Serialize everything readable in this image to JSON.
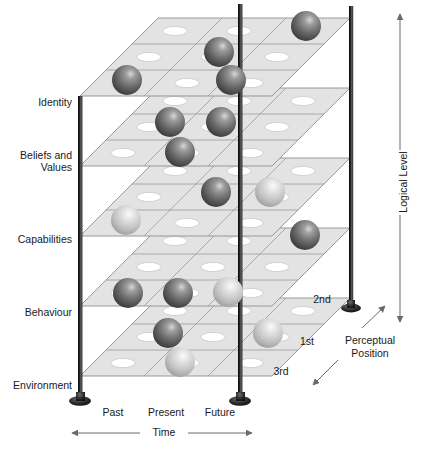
{
  "figure": {
    "type": "diagram",
    "background_color": "#ffffff",
    "line_color": "#1a1a1a",
    "plane_fill": "#e2e2e2",
    "plane_edge": "#9a9a9a",
    "cell_hole_fill": "#ffffff",
    "sphere_dark": "#6f6f6f",
    "sphere_light": "#cdcdcd"
  },
  "axes": {
    "vertical": {
      "label": "Logical Level",
      "arrow": "double",
      "levels": [
        {
          "label": "Identity"
        },
        {
          "label": "Beliefs and"
        },
        {
          "label": "Values"
        },
        {
          "label": "Capabilities"
        },
        {
          "label": "Behaviour"
        },
        {
          "label": "Environment"
        }
      ]
    },
    "horizontal": {
      "label": "Time",
      "arrow": "double",
      "ticks": [
        "Past",
        "Present",
        "Future"
      ]
    },
    "depth": {
      "label_line1": "Perceptual",
      "label_line2": "Position",
      "arrow": "double",
      "positions": [
        "1st",
        "2nd",
        "3rd"
      ]
    }
  },
  "level_labels": {
    "identity": "Identity",
    "beliefs": "Beliefs and",
    "values": "Values",
    "capabilities": "Capabilities",
    "behaviour": "Behaviour",
    "environment": "Environment"
  },
  "time_labels": {
    "past": "Past",
    "present": "Present",
    "future": "Future",
    "axis": "Time"
  },
  "perceptual_labels": {
    "first": "1st",
    "second": "2nd",
    "third": "3rd",
    "axis_line1": "Perceptual",
    "axis_line2": "Position"
  },
  "logical_axis_label": "Logical Level",
  "planes": [
    {
      "name": "identity-plane",
      "level": "Identity",
      "rows": 3,
      "cols": 3
    },
    {
      "name": "beliefs-plane",
      "level": "Beliefs and Values",
      "rows": 3,
      "cols": 3
    },
    {
      "name": "capabilities-plane",
      "level": "Capabilities",
      "rows": 3,
      "cols": 3
    },
    {
      "name": "behaviour-plane",
      "level": "Behaviour",
      "rows": 3,
      "cols": 3
    },
    {
      "name": "environment-plane",
      "level": "Environment",
      "rows": 3,
      "cols": 3
    }
  ],
  "poles": [
    {
      "name": "pole-left",
      "has_base": true
    },
    {
      "name": "pole-middle",
      "has_base": true
    },
    {
      "name": "pole-right",
      "has_base": true
    }
  ],
  "spheres": [
    {
      "shade": "dark",
      "cx": 127,
      "cy": 80,
      "r": 15
    },
    {
      "shade": "dark",
      "cx": 219,
      "cy": 52,
      "r": 15
    },
    {
      "shade": "dark",
      "cx": 231,
      "cy": 80,
      "r": 15
    },
    {
      "shade": "dark",
      "cx": 306,
      "cy": 26,
      "r": 15
    },
    {
      "shade": "dark",
      "cx": 170,
      "cy": 122,
      "r": 15
    },
    {
      "shade": "dark",
      "cx": 221,
      "cy": 122,
      "r": 15
    },
    {
      "shade": "dark",
      "cx": 180,
      "cy": 152,
      "r": 15
    },
    {
      "shade": "dark",
      "cx": 216,
      "cy": 192,
      "r": 15
    },
    {
      "shade": "light",
      "cx": 270,
      "cy": 192,
      "r": 15
    },
    {
      "shade": "light",
      "cx": 126,
      "cy": 220,
      "r": 15
    },
    {
      "shade": "dark",
      "cx": 305,
      "cy": 235,
      "r": 15
    },
    {
      "shade": "dark",
      "cx": 128,
      "cy": 293,
      "r": 15
    },
    {
      "shade": "dark",
      "cx": 178,
      "cy": 293,
      "r": 15
    },
    {
      "shade": "light",
      "cx": 228,
      "cy": 292,
      "r": 15
    },
    {
      "shade": "dark",
      "cx": 168,
      "cy": 333,
      "r": 15
    },
    {
      "shade": "light",
      "cx": 268,
      "cy": 333,
      "r": 15
    },
    {
      "shade": "light",
      "cx": 180,
      "cy": 362,
      "r": 15
    }
  ]
}
